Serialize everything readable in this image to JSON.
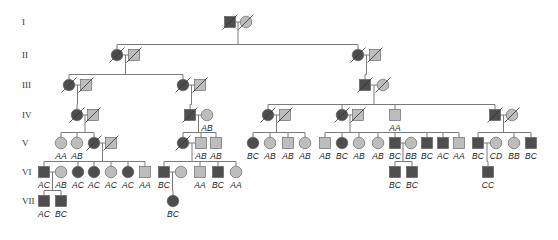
{
  "colors": {
    "affected": "#4e4e4e",
    "unaffected": "#bdbdbd",
    "outline": "#555555",
    "line": "#7a7a7a",
    "text": "#222222"
  },
  "symbol_size": 11,
  "generations": [
    {
      "label": "I",
      "y": 22
    },
    {
      "label": "II",
      "y": 55
    },
    {
      "label": "III",
      "y": 85
    },
    {
      "label": "IV",
      "y": 115
    },
    {
      "label": "V",
      "y": 143
    },
    {
      "label": "VI",
      "y": 172
    },
    {
      "label": "VII",
      "y": 201
    }
  ],
  "individuals": [
    {
      "id": "I-1",
      "gen": 0,
      "x": 230,
      "sex": "M",
      "affected": true,
      "deceased": true,
      "genotype": ""
    },
    {
      "id": "I-2",
      "gen": 0,
      "x": 246,
      "sex": "F",
      "affected": false,
      "deceased": true,
      "genotype": ""
    },
    {
      "id": "II-1",
      "gen": 1,
      "x": 117,
      "sex": "F",
      "affected": true,
      "deceased": true,
      "genotype": ""
    },
    {
      "id": "II-2",
      "gen": 1,
      "x": 134,
      "sex": "M",
      "affected": false,
      "deceased": true,
      "genotype": ""
    },
    {
      "id": "II-3",
      "gen": 1,
      "x": 358,
      "sex": "F",
      "affected": true,
      "deceased": true,
      "genotype": ""
    },
    {
      "id": "II-4",
      "gen": 1,
      "x": 375,
      "sex": "M",
      "affected": false,
      "deceased": true,
      "genotype": ""
    },
    {
      "id": "III-1",
      "gen": 2,
      "x": 69,
      "sex": "F",
      "affected": true,
      "deceased": true,
      "genotype": ""
    },
    {
      "id": "III-2",
      "gen": 2,
      "x": 86,
      "sex": "M",
      "affected": false,
      "deceased": true,
      "genotype": ""
    },
    {
      "id": "III-3",
      "gen": 2,
      "x": 183,
      "sex": "F",
      "affected": true,
      "deceased": true,
      "genotype": ""
    },
    {
      "id": "III-4",
      "gen": 2,
      "x": 200,
      "sex": "M",
      "affected": false,
      "deceased": true,
      "genotype": ""
    },
    {
      "id": "III-5",
      "gen": 2,
      "x": 365,
      "sex": "M",
      "affected": true,
      "deceased": true,
      "genotype": ""
    },
    {
      "id": "III-6",
      "gen": 2,
      "x": 383,
      "sex": "F",
      "affected": false,
      "deceased": true,
      "genotype": ""
    },
    {
      "id": "IV-1",
      "gen": 3,
      "x": 77,
      "sex": "F",
      "affected": true,
      "deceased": true,
      "genotype": ""
    },
    {
      "id": "IV-2",
      "gen": 3,
      "x": 93,
      "sex": "M",
      "affected": false,
      "deceased": true,
      "genotype": ""
    },
    {
      "id": "IV-3",
      "gen": 3,
      "x": 190,
      "sex": "M",
      "affected": true,
      "deceased": true,
      "genotype": ""
    },
    {
      "id": "IV-4",
      "gen": 3,
      "x": 207,
      "sex": "F",
      "affected": false,
      "deceased": false,
      "genotype": "AB"
    },
    {
      "id": "IV-5",
      "gen": 3,
      "x": 268,
      "sex": "F",
      "affected": true,
      "deceased": true,
      "genotype": ""
    },
    {
      "id": "IV-6",
      "gen": 3,
      "x": 285,
      "sex": "M",
      "affected": false,
      "deceased": true,
      "genotype": ""
    },
    {
      "id": "IV-7",
      "gen": 3,
      "x": 342,
      "sex": "F",
      "affected": true,
      "deceased": true,
      "genotype": ""
    },
    {
      "id": "IV-8",
      "gen": 3,
      "x": 358,
      "sex": "M",
      "affected": false,
      "deceased": true,
      "genotype": ""
    },
    {
      "id": "IV-9",
      "gen": 3,
      "x": 395,
      "sex": "M",
      "affected": false,
      "deceased": false,
      "genotype": "AA"
    },
    {
      "id": "IV-10",
      "gen": 3,
      "x": 495,
      "sex": "M",
      "affected": true,
      "deceased": true,
      "genotype": ""
    },
    {
      "id": "IV-11",
      "gen": 3,
      "x": 512,
      "sex": "F",
      "affected": false,
      "deceased": true,
      "genotype": ""
    },
    {
      "id": "V-1",
      "gen": 4,
      "x": 61,
      "sex": "F",
      "affected": false,
      "deceased": false,
      "genotype": "AA"
    },
    {
      "id": "V-2",
      "gen": 4,
      "x": 77,
      "sex": "F",
      "affected": false,
      "deceased": false,
      "genotype": "AB"
    },
    {
      "id": "V-3",
      "gen": 4,
      "x": 94,
      "sex": "F",
      "affected": true,
      "deceased": true,
      "genotype": ""
    },
    {
      "id": "V-4",
      "gen": 4,
      "x": 111,
      "sex": "M",
      "affected": false,
      "deceased": true,
      "genotype": ""
    },
    {
      "id": "V-5",
      "gen": 4,
      "x": 183,
      "sex": "F",
      "affected": true,
      "deceased": true,
      "genotype": ""
    },
    {
      "id": "V-6",
      "gen": 4,
      "x": 201,
      "sex": "M",
      "affected": false,
      "deceased": false,
      "genotype": "AB"
    },
    {
      "id": "V-7",
      "gen": 4,
      "x": 216,
      "sex": "M",
      "affected": false,
      "deceased": false,
      "genotype": "AB"
    },
    {
      "id": "V-8",
      "gen": 4,
      "x": 253,
      "sex": "F",
      "affected": true,
      "deceased": false,
      "genotype": "BC"
    },
    {
      "id": "V-9",
      "gen": 4,
      "x": 270,
      "sex": "F",
      "affected": false,
      "deceased": false,
      "genotype": "AB"
    },
    {
      "id": "V-10",
      "gen": 4,
      "x": 288,
      "sex": "M",
      "affected": false,
      "deceased": false,
      "genotype": "AB"
    },
    {
      "id": "V-11",
      "gen": 4,
      "x": 305,
      "sex": "F",
      "affected": false,
      "deceased": false,
      "genotype": "AB"
    },
    {
      "id": "V-12",
      "gen": 4,
      "x": 325,
      "sex": "M",
      "affected": false,
      "deceased": false,
      "genotype": "AB"
    },
    {
      "id": "V-13",
      "gen": 4,
      "x": 342,
      "sex": "F",
      "affected": true,
      "deceased": false,
      "genotype": "BC"
    },
    {
      "id": "V-14",
      "gen": 4,
      "x": 359,
      "sex": "F",
      "affected": false,
      "deceased": false,
      "genotype": "AB"
    },
    {
      "id": "V-15",
      "gen": 4,
      "x": 378,
      "sex": "F",
      "affected": false,
      "deceased": false,
      "genotype": "AB"
    },
    {
      "id": "V-16",
      "gen": 4,
      "x": 395,
      "sex": "M",
      "affected": true,
      "deceased": false,
      "genotype": "BC"
    },
    {
      "id": "V-17",
      "gen": 4,
      "x": 411,
      "sex": "F",
      "affected": false,
      "deceased": false,
      "genotype": "BB"
    },
    {
      "id": "V-18",
      "gen": 4,
      "x": 427,
      "sex": "M",
      "affected": true,
      "deceased": false,
      "genotype": "BC"
    },
    {
      "id": "V-19",
      "gen": 4,
      "x": 443,
      "sex": "M",
      "affected": true,
      "deceased": false,
      "genotype": "AC"
    },
    {
      "id": "V-20",
      "gen": 4,
      "x": 459,
      "sex": "M",
      "affected": false,
      "deceased": false,
      "genotype": "AA"
    },
    {
      "id": "V-21",
      "gen": 4,
      "x": 478,
      "sex": "M",
      "affected": true,
      "deceased": false,
      "genotype": "BC"
    },
    {
      "id": "V-22",
      "gen": 4,
      "x": 496,
      "sex": "F",
      "affected": false,
      "deceased": false,
      "genotype": "CD"
    },
    {
      "id": "V-23",
      "gen": 4,
      "x": 514,
      "sex": "F",
      "affected": false,
      "deceased": false,
      "genotype": "BB"
    },
    {
      "id": "V-24",
      "gen": 4,
      "x": 531,
      "sex": "M",
      "affected": true,
      "deceased": false,
      "genotype": "BC"
    },
    {
      "id": "VI-1",
      "gen": 5,
      "x": 44,
      "sex": "M",
      "affected": true,
      "deceased": false,
      "genotype": "AC"
    },
    {
      "id": "VI-2",
      "gen": 5,
      "x": 61,
      "sex": "F",
      "affected": false,
      "deceased": false,
      "genotype": "AB"
    },
    {
      "id": "VI-3",
      "gen": 5,
      "x": 78,
      "sex": "F",
      "affected": true,
      "deceased": false,
      "genotype": "AC"
    },
    {
      "id": "VI-4",
      "gen": 5,
      "x": 94,
      "sex": "F",
      "affected": true,
      "deceased": false,
      "genotype": "AC"
    },
    {
      "id": "VI-5",
      "gen": 5,
      "x": 111,
      "sex": "F",
      "affected": false,
      "deceased": false,
      "genotype": "AC"
    },
    {
      "id": "VI-6",
      "gen": 5,
      "x": 128,
      "sex": "F",
      "affected": true,
      "deceased": false,
      "genotype": "AC"
    },
    {
      "id": "VI-7",
      "gen": 5,
      "x": 145,
      "sex": "M",
      "affected": false,
      "deceased": false,
      "genotype": "AA"
    },
    {
      "id": "VI-8",
      "gen": 5,
      "x": 164,
      "sex": "M",
      "affected": true,
      "deceased": false,
      "genotype": "BC"
    },
    {
      "id": "VI-9",
      "gen": 5,
      "x": 181,
      "sex": "F",
      "affected": false,
      "deceased": false,
      "genotype": ""
    },
    {
      "id": "VI-10",
      "gen": 5,
      "x": 200,
      "sex": "M",
      "affected": false,
      "deceased": false,
      "genotype": "AA"
    },
    {
      "id": "VI-11",
      "gen": 5,
      "x": 218,
      "sex": "M",
      "affected": true,
      "deceased": false,
      "genotype": "BC"
    },
    {
      "id": "VI-12",
      "gen": 5,
      "x": 236,
      "sex": "F",
      "affected": false,
      "deceased": false,
      "genotype": "AA"
    },
    {
      "id": "VI-13",
      "gen": 5,
      "x": 395,
      "sex": "M",
      "affected": true,
      "deceased": false,
      "genotype": "BC"
    },
    {
      "id": "VI-14",
      "gen": 5,
      "x": 412,
      "sex": "M",
      "affected": true,
      "deceased": false,
      "genotype": "BC"
    },
    {
      "id": "VI-15",
      "gen": 5,
      "x": 488,
      "sex": "M",
      "affected": true,
      "deceased": false,
      "genotype": "CC"
    },
    {
      "id": "VII-1",
      "gen": 6,
      "x": 44,
      "sex": "M",
      "affected": true,
      "deceased": false,
      "genotype": "AC"
    },
    {
      "id": "VII-2",
      "gen": 6,
      "x": 61,
      "sex": "M",
      "affected": true,
      "deceased": false,
      "genotype": "BC"
    },
    {
      "id": "VII-3",
      "gen": 6,
      "x": 173,
      "sex": "F",
      "affected": true,
      "deceased": false,
      "genotype": "BC"
    }
  ],
  "matings": [
    {
      "a": "I-1",
      "b": "I-2",
      "children": [
        "II-1",
        "II-3"
      ]
    },
    {
      "a": "II-1",
      "b": "II-2",
      "children": [
        "III-1",
        "III-3"
      ]
    },
    {
      "a": "II-3",
      "b": "II-4",
      "children": [
        "III-5"
      ]
    },
    {
      "a": "III-1",
      "b": "III-2",
      "children": [
        "IV-1"
      ]
    },
    {
      "a": "III-3",
      "b": "III-4",
      "children": [
        "IV-3"
      ]
    },
    {
      "a": "III-5",
      "b": "III-6",
      "children": [
        "IV-5",
        "IV-7",
        "IV-9",
        "IV-10"
      ]
    },
    {
      "a": "IV-1",
      "b": "IV-2",
      "children": [
        "V-1",
        "V-2",
        "V-3"
      ]
    },
    {
      "a": "IV-3",
      "b": "IV-4",
      "children": [
        "V-5",
        "V-6",
        "V-7"
      ]
    },
    {
      "a": "IV-5",
      "b": "IV-6",
      "children": [
        "V-8",
        "V-9",
        "V-10",
        "V-11"
      ]
    },
    {
      "a": "IV-7",
      "b": "IV-8",
      "children": [
        "V-12",
        "V-13",
        "V-14",
        "V-15",
        "V-16",
        "V-18",
        "V-19",
        "V-20"
      ]
    },
    {
      "a": "IV-10",
      "b": "IV-11",
      "children": [
        "V-21",
        "V-23",
        "V-24"
      ]
    },
    {
      "a": "V-3",
      "b": "V-4",
      "children": [
        "VI-1",
        "VI-3",
        "VI-4",
        "VI-5",
        "VI-6",
        "VI-7"
      ]
    },
    {
      "a": "V-5",
      "b": "V-6",
      "children": [
        "VI-8",
        "VI-10",
        "VI-11",
        "VI-12"
      ]
    },
    {
      "a": "V-16",
      "b": "V-17",
      "children": [
        "VI-13",
        "VI-14"
      ]
    },
    {
      "a": "V-21",
      "b": "V-22",
      "children": [
        "VI-15"
      ]
    },
    {
      "a": "VI-1",
      "b": "VI-2",
      "children": [
        "VII-1",
        "VII-2"
      ]
    },
    {
      "a": "VI-8",
      "b": "VI-9",
      "children": [
        "VII-3"
      ]
    }
  ]
}
